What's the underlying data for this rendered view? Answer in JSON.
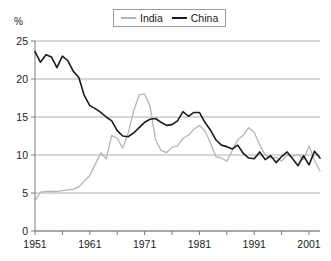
{
  "chart_data": {
    "type": "line",
    "title": "",
    "subtitle": "",
    "xlabel": "",
    "ylabel": "%",
    "ylim": [
      0,
      25
    ],
    "xlim": [
      1951,
      2003
    ],
    "grid": true,
    "legend_position": "top-center",
    "y_ticks": [
      0,
      5,
      10,
      15,
      20,
      25
    ],
    "y_tick_labels": [
      "0",
      "5",
      "10",
      "15",
      "20",
      "25"
    ],
    "x_ticks": [
      1951,
      1961,
      1971,
      1981,
      1991,
      2001
    ],
    "x_tick_labels": [
      "1951",
      "1961",
      "1971",
      "1981",
      "1991",
      "2001"
    ],
    "x_minor_ticks": [
      1956,
      1966,
      1976,
      1986,
      1996
    ],
    "colors": {
      "india": "#b5b5b5",
      "china": "#1b1b1b",
      "grid": "#b0b0b0",
      "axis": "#7a7a7a"
    },
    "x": [
      1951,
      1952,
      1953,
      1954,
      1955,
      1956,
      1957,
      1958,
      1959,
      1960,
      1961,
      1962,
      1963,
      1964,
      1965,
      1966,
      1967,
      1968,
      1969,
      1970,
      1971,
      1972,
      1973,
      1974,
      1975,
      1976,
      1977,
      1978,
      1979,
      1980,
      1981,
      1982,
      1983,
      1984,
      1985,
      1986,
      1987,
      1988,
      1989,
      1990,
      1991,
      1992,
      1993,
      1994,
      1995,
      1996,
      1997,
      1998,
      1999,
      2000,
      2001,
      2002,
      2003
    ],
    "series": [
      {
        "name": "India",
        "color": "#b5b5b5",
        "values": [
          4.0,
          5.1,
          5.2,
          5.2,
          5.2,
          5.3,
          5.4,
          5.5,
          5.8,
          6.6,
          7.3,
          8.8,
          10.3,
          9.5,
          12.6,
          12.2,
          10.9,
          12.9,
          15.8,
          17.9,
          18.0,
          16.4,
          12.0,
          10.6,
          10.3,
          11.0,
          11.2,
          12.2,
          12.6,
          13.4,
          13.9,
          13.2,
          11.6,
          9.8,
          9.6,
          9.2,
          10.6,
          12.0,
          12.6,
          13.6,
          13.0,
          11.3,
          10.0,
          9.6,
          9.7,
          9.2,
          10.0,
          9.8,
          10.1,
          9.4,
          11.2,
          9.3,
          7.9
        ]
      },
      {
        "name": "China",
        "color": "#1b1b1b",
        "values": [
          23.6,
          22.2,
          23.2,
          22.9,
          21.5,
          23.0,
          22.4,
          21.0,
          20.2,
          17.8,
          16.5,
          16.1,
          15.6,
          15.0,
          14.5,
          13.2,
          12.5,
          12.4,
          12.9,
          13.6,
          14.3,
          14.7,
          14.8,
          14.3,
          13.9,
          14.0,
          14.5,
          15.7,
          15.1,
          15.6,
          15.6,
          14.3,
          13.3,
          12.0,
          11.3,
          11.1,
          10.8,
          11.3,
          10.2,
          9.6,
          9.5,
          10.4,
          9.4,
          9.9,
          9.0,
          9.8,
          10.4,
          9.5,
          8.6,
          9.9,
          8.7,
          10.5,
          9.6
        ]
      }
    ]
  },
  "legend": {
    "entries": [
      {
        "label": "India",
        "key": "india"
      },
      {
        "label": "China",
        "key": "china"
      }
    ]
  },
  "axis": {
    "unit_label": "%"
  }
}
